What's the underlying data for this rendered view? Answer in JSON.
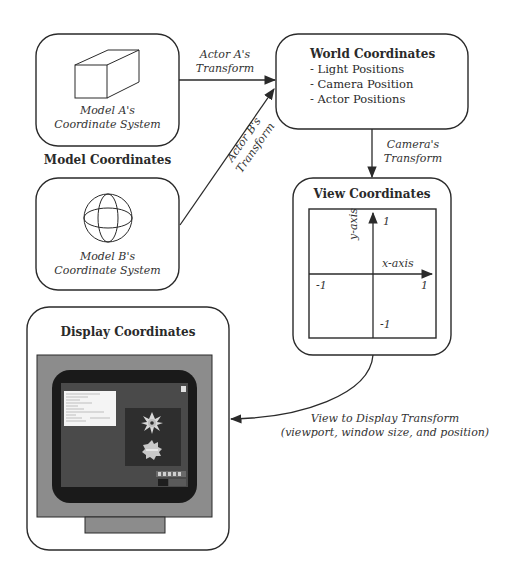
{
  "diagram": {
    "model_a": {
      "caption_line1": "Model A's",
      "caption_line2": "Coordinate System",
      "icon": "box-icon"
    },
    "model_b": {
      "caption_line1": "Model B's",
      "caption_line2": "Coordinate System",
      "icon": "sphere-icon"
    },
    "model_coordinates_title": "Model Coordinates",
    "world": {
      "title": "World Coordinates",
      "items": [
        "- Light Positions",
        "- Camera Position",
        "- Actor Positions"
      ]
    },
    "view": {
      "title": "View Coordinates",
      "x_axis_label": "x-axis",
      "y_axis_label": "y-axis",
      "y_top": "1",
      "y_bottom": "-1",
      "x_left": "-1",
      "x_right": "1"
    },
    "display": {
      "title": "Display Coordinates",
      "icon": "monitor-icon"
    },
    "edges": {
      "actor_a_line1": "Actor A's",
      "actor_a_line2": "Transform",
      "actor_b_line1": "Actor B's",
      "actor_b_line2": "Transform",
      "camera_line1": "Camera's",
      "camera_line2": "Transform",
      "view_display_line1": "View to Display Transform",
      "view_display_line2": "(viewport, window size, and position)"
    },
    "colors": {
      "stroke": "#2a2a2a",
      "monitor_bezel": "#8c8c8c",
      "monitor_screen_border": "#1a1a1a",
      "monitor_screen": "#4a4a4a",
      "monitor_panel": "#2e2e2e",
      "monitor_window": "#f4f4f4"
    }
  }
}
